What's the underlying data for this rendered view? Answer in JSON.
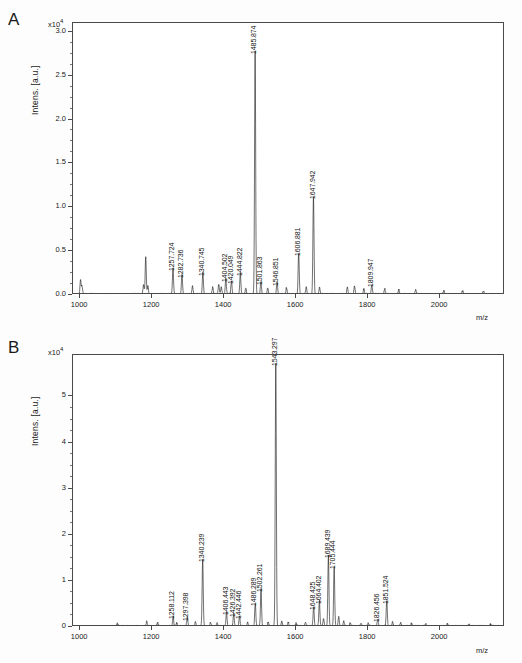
{
  "figure": {
    "panels": [
      {
        "letter": "A",
        "ylabel": "Intens. [a.u.]",
        "exponent_prefix": "x10",
        "exponent_power": "4",
        "xlabel": "m/z"
      },
      {
        "letter": "B",
        "ylabel": "Intens. [a.u.]",
        "exponent_prefix": "x10",
        "exponent_power": "4",
        "xlabel": "m/z"
      }
    ]
  },
  "chart_data": [
    {
      "type": "line",
      "panel": "A",
      "title": "",
      "xlabel": "m/z",
      "ylabel": "Intens. [a.u.]",
      "y_exponent": "x10^4",
      "xlim": [
        980,
        2180
      ],
      "ylim": [
        0.0,
        3.1
      ],
      "xticks": [
        1000,
        1200,
        1400,
        1600,
        1800,
        2000
      ],
      "xtick_labels": [
        "1000",
        "1200",
        "1400",
        "1600",
        "1800",
        "2000"
      ],
      "yticks": [
        0.0,
        0.5,
        1.0,
        1.5,
        2.0,
        2.5,
        3.0
      ],
      "ytick_labels": [
        "0.0",
        "0.5",
        "1.0",
        "1.5",
        "2.0",
        "2.5",
        "3.0"
      ],
      "grid": false,
      "legend": "none",
      "annotations": [
        {
          "label": "1257.724",
          "mz": 1257.724,
          "intensity": 0.3
        },
        {
          "label": "1282.736",
          "mz": 1282.736,
          "intensity": 0.22
        },
        {
          "label": "1340.745",
          "mz": 1340.745,
          "intensity": 0.24
        },
        {
          "label": "1404.502",
          "mz": 1404.502,
          "intensity": 0.17
        },
        {
          "label": "1420.049",
          "mz": 1420.049,
          "intensity": 0.15
        },
        {
          "label": "1444.822",
          "mz": 1444.822,
          "intensity": 0.24
        },
        {
          "label": "1501.863",
          "mz": 1501.863,
          "intensity": 0.14
        },
        {
          "label": "1546.851",
          "mz": 1546.851,
          "intensity": 0.13
        },
        {
          "label": "1606.881",
          "mz": 1606.881,
          "intensity": 0.47
        },
        {
          "label": "1647.942",
          "mz": 1647.942,
          "intensity": 1.12
        },
        {
          "label": "1809.947",
          "mz": 1809.947,
          "intensity": 0.11
        },
        {
          "label": "1485.874",
          "mz": 1485.874,
          "intensity": 2.77
        }
      ],
      "peaks": [
        {
          "mz": 1485.874,
          "intensity": 2.77
        },
        {
          "mz": 1647.942,
          "intensity": 1.12
        },
        {
          "mz": 1606.881,
          "intensity": 0.47
        },
        {
          "mz": 1257.724,
          "intensity": 0.3
        },
        {
          "mz": 1340.745,
          "intensity": 0.24
        },
        {
          "mz": 1444.822,
          "intensity": 0.24
        },
        {
          "mz": 1282.736,
          "intensity": 0.22
        },
        {
          "mz": 1182.0,
          "intensity": 0.21
        },
        {
          "mz": 1404.502,
          "intensity": 0.17
        },
        {
          "mz": 1420.049,
          "intensity": 0.15
        },
        {
          "mz": 1501.863,
          "intensity": 0.14
        },
        {
          "mz": 1546.851,
          "intensity": 0.13
        },
        {
          "mz": 1809.947,
          "intensity": 0.11
        }
      ]
    },
    {
      "type": "line",
      "panel": "B",
      "title": "",
      "xlabel": "m/z",
      "ylabel": "Intens. [a.u.]",
      "y_exponent": "x10^4",
      "xlim": [
        980,
        2180
      ],
      "ylim": [
        0,
        5.9
      ],
      "xticks": [
        1000,
        1200,
        1400,
        1600,
        1800,
        2000
      ],
      "xtick_labels": [
        "1000",
        "1200",
        "1400",
        "1600",
        "1800",
        "2000"
      ],
      "yticks": [
        0,
        1,
        2,
        3,
        4,
        5
      ],
      "ytick_labels": [
        "0",
        "1",
        "2",
        "3",
        "4",
        "5"
      ],
      "grid": false,
      "legend": "none",
      "annotations": [
        {
          "label": "1258.112",
          "mz": 1258.112,
          "intensity": 0.22
        },
        {
          "label": "1297.398",
          "mz": 1297.398,
          "intensity": 0.18
        },
        {
          "label": "1340.239",
          "mz": 1340.239,
          "intensity": 1.45
        },
        {
          "label": "1406.443",
          "mz": 1406.443,
          "intensity": 0.3
        },
        {
          "label": "1426.392",
          "mz": 1426.392,
          "intensity": 0.26
        },
        {
          "label": "1442.446",
          "mz": 1442.446,
          "intensity": 0.22
        },
        {
          "label": "1486.289",
          "mz": 1486.289,
          "intensity": 0.5
        },
        {
          "label": "1502.261",
          "mz": 1502.261,
          "intensity": 0.8
        },
        {
          "label": "1543.297",
          "mz": 1543.297,
          "intensity": 5.7
        },
        {
          "label": "1648.425",
          "mz": 1648.425,
          "intensity": 0.42
        },
        {
          "label": "1664.402",
          "mz": 1664.402,
          "intensity": 0.55
        },
        {
          "label": "1689.439",
          "mz": 1689.439,
          "intensity": 1.55
        },
        {
          "label": "1705.444",
          "mz": 1705.444,
          "intensity": 1.3
        },
        {
          "label": "1826.456",
          "mz": 1826.456,
          "intensity": 0.15
        },
        {
          "label": "1851.524",
          "mz": 1851.524,
          "intensity": 0.55
        }
      ],
      "peaks": [
        {
          "mz": 1543.297,
          "intensity": 5.7
        },
        {
          "mz": 1689.439,
          "intensity": 1.55
        },
        {
          "mz": 1340.239,
          "intensity": 1.45
        },
        {
          "mz": 1705.444,
          "intensity": 1.3
        },
        {
          "mz": 1502.261,
          "intensity": 0.8
        },
        {
          "mz": 1664.402,
          "intensity": 0.55
        },
        {
          "mz": 1851.524,
          "intensity": 0.55
        },
        {
          "mz": 1486.289,
          "intensity": 0.5
        },
        {
          "mz": 1648.425,
          "intensity": 0.42
        },
        {
          "mz": 1406.443,
          "intensity": 0.3
        },
        {
          "mz": 1426.392,
          "intensity": 0.26
        },
        {
          "mz": 1258.112,
          "intensity": 0.22
        },
        {
          "mz": 1442.446,
          "intensity": 0.22
        },
        {
          "mz": 1297.398,
          "intensity": 0.18
        },
        {
          "mz": 1826.456,
          "intensity": 0.15
        }
      ]
    }
  ]
}
